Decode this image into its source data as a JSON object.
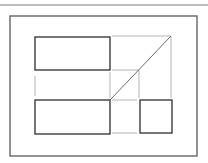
{
  "canvas": {
    "width": 208,
    "height": 163,
    "background": "#ffffff"
  },
  "colors": {
    "frame": "#5a5a5a",
    "box": "#3c3c3c",
    "guide": "#b4b4b4",
    "diagonal": "#6a6a6a",
    "rule": "#7a7a7a"
  },
  "top_rule": {
    "x1": 0,
    "y1": 5,
    "x2": 208,
    "y2": 5
  },
  "outer_frame": {
    "x": 10,
    "y": 16,
    "width": 187,
    "height": 140
  },
  "boxes": [
    {
      "id": "rect-top-left",
      "x": 35,
      "y": 37,
      "width": 75,
      "height": 33
    },
    {
      "id": "rect-bottom-left",
      "x": 35,
      "y": 100,
      "width": 75,
      "height": 34
    },
    {
      "id": "square-bottom-right",
      "x": 140,
      "y": 100,
      "width": 32,
      "height": 33
    }
  ],
  "guides": [
    {
      "x1": 112,
      "y1": 36,
      "x2": 171,
      "y2": 36
    },
    {
      "x1": 171,
      "y1": 36,
      "x2": 171,
      "y2": 98
    },
    {
      "x1": 112,
      "y1": 70,
      "x2": 139,
      "y2": 70
    },
    {
      "x1": 139,
      "y1": 70,
      "x2": 139,
      "y2": 98
    },
    {
      "x1": 112,
      "y1": 100,
      "x2": 137,
      "y2": 100
    },
    {
      "x1": 112,
      "y1": 133,
      "x2": 137,
      "y2": 133
    },
    {
      "x1": 35,
      "y1": 76,
      "x2": 35,
      "y2": 96
    },
    {
      "x1": 110,
      "y1": 72,
      "x2": 110,
      "y2": 98
    }
  ],
  "diagonal": {
    "x1": 110,
    "y1": 100,
    "x2": 171,
    "y2": 36
  }
}
